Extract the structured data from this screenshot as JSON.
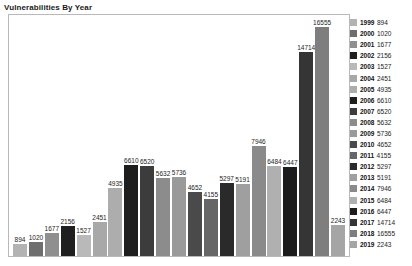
{
  "chart_data": {
    "type": "bar",
    "title": "Vulnerabilities By Year",
    "xlabel": "",
    "ylabel": "",
    "grid": false,
    "legend_position": "right",
    "ylim": [
      0,
      16555
    ],
    "categories": [
      "1999",
      "2000",
      "2001",
      "2002",
      "2003",
      "2004",
      "2005",
      "2006",
      "2007",
      "2008",
      "2009",
      "2010",
      "2011",
      "2012",
      "2013",
      "2014",
      "2015",
      "2016",
      "2017",
      "2018",
      "2019"
    ],
    "values": [
      894,
      1020,
      1677,
      2156,
      1527,
      2451,
      4935,
      6610,
      6520,
      5632,
      5736,
      4652,
      4155,
      5297,
      5191,
      7946,
      6484,
      6447,
      14714,
      16555,
      2243
    ],
    "colors": [
      "#b3b3b3",
      "#6e6e6e",
      "#8f8f8f",
      "#1f1f1f",
      "#b9b9b9",
      "#a8a8a8",
      "#adadad",
      "#1e1e1e",
      "#3c3c3c",
      "#8c8c8c",
      "#9a9a9a",
      "#4a4a4a",
      "#666666",
      "#2a2a2a",
      "#9f9f9f",
      "#8a8a8a",
      "#b0b0b0",
      "#1c1c1c",
      "#353535",
      "#7e7e7e",
      "#a5a5a5"
    ],
    "bar_labels": [
      "894",
      "1020",
      "1677",
      "2156",
      "1527",
      "2451",
      "4935",
      "6610",
      "6520",
      "5632",
      "5736",
      "4652",
      "4155",
      "5297",
      "5191",
      "7946",
      "6484",
      "6447",
      "14714",
      "16555",
      "2243"
    ]
  },
  "legend": {
    "entries": [
      {
        "year": "1999",
        "value": "894"
      },
      {
        "year": "2000",
        "value": "1020"
      },
      {
        "year": "2001",
        "value": "1677"
      },
      {
        "year": "2002",
        "value": "2156"
      },
      {
        "year": "2003",
        "value": "1527"
      },
      {
        "year": "2004",
        "value": "2451"
      },
      {
        "year": "2005",
        "value": "4935"
      },
      {
        "year": "2006",
        "value": "6610"
      },
      {
        "year": "2007",
        "value": "6520"
      },
      {
        "year": "2008",
        "value": "5632"
      },
      {
        "year": "2009",
        "value": "5736"
      },
      {
        "year": "2010",
        "value": "4652"
      },
      {
        "year": "2011",
        "value": "4155"
      },
      {
        "year": "2012",
        "value": "5297"
      },
      {
        "year": "2013",
        "value": "5191"
      },
      {
        "year": "2014",
        "value": "7946"
      },
      {
        "year": "2015",
        "value": "6484"
      },
      {
        "year": "2016",
        "value": "6447"
      },
      {
        "year": "2017",
        "value": "14714"
      },
      {
        "year": "2018",
        "value": "16555"
      },
      {
        "year": "2019",
        "value": "2243"
      }
    ]
  }
}
